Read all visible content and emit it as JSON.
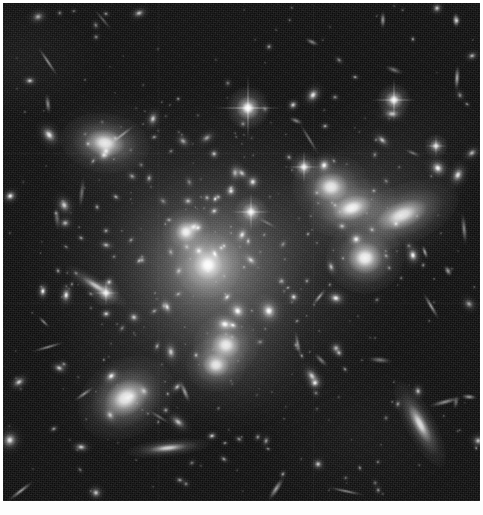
{
  "image": {
    "title": "Galaxy cluster deep field",
    "subject": "galaxy-cluster",
    "modality": "optical-grayscale",
    "width_px": 483,
    "height_px": 515,
    "border": {
      "color": "#ffffff",
      "top_px": 3,
      "left_px": 3,
      "right_px": 3,
      "bottom_px": 14
    },
    "background_color": "#101010",
    "frame": {
      "x": 3,
      "y": 3,
      "width": 477,
      "height": 498
    }
  },
  "palette": {
    "sky": "#101010",
    "faint_source": "#6e6e6e",
    "mid_source": "#b8b8b8",
    "bright_source": "#ffffff",
    "halo": "#8c8c8c",
    "border": "#ffffff"
  },
  "intracluster_light": [
    {
      "name": "main-halo",
      "cx": 218,
      "cy": 262,
      "rx": 150,
      "ry": 130,
      "peak": 0.3,
      "blur": 44
    },
    {
      "name": "core-halo",
      "cx": 212,
      "cy": 268,
      "rx": 78,
      "ry": 72,
      "peak": 0.4,
      "blur": 28
    },
    {
      "name": "inner-core-glow",
      "cx": 207,
      "cy": 265,
      "rx": 34,
      "ry": 32,
      "peak": 0.55,
      "blur": 16
    },
    {
      "name": "ne-group-halo",
      "cx": 372,
      "cy": 208,
      "rx": 78,
      "ry": 52,
      "peak": 0.26,
      "blur": 26
    },
    {
      "name": "se-group-halo",
      "cx": 232,
      "cy": 358,
      "rx": 62,
      "ry": 48,
      "peak": 0.18,
      "blur": 24
    },
    {
      "name": "nw-wisp-halo",
      "cx": 108,
      "cy": 145,
      "rx": 52,
      "ry": 36,
      "peak": 0.14,
      "blur": 22
    }
  ],
  "bright_stars": [
    {
      "name": "star-top-center",
      "cx": 248,
      "cy": 108,
      "size": 9,
      "spike": 66,
      "brightness": 1.0
    },
    {
      "name": "star-upper-right",
      "cx": 394,
      "cy": 100,
      "size": 7,
      "spike": 44,
      "brightness": 0.95
    },
    {
      "name": "star-mid-center",
      "cx": 251,
      "cy": 212,
      "size": 7,
      "spike": 40,
      "brightness": 0.92
    },
    {
      "name": "star-mid-upper",
      "cx": 304,
      "cy": 167,
      "size": 6,
      "spike": 34,
      "brightness": 0.88
    },
    {
      "name": "star-lower-left",
      "cx": 106,
      "cy": 293,
      "size": 6,
      "spike": 26,
      "brightness": 0.85
    },
    {
      "name": "star-right-edge",
      "cx": 436,
      "cy": 146,
      "size": 5,
      "spike": 22,
      "brightness": 0.8
    }
  ],
  "galaxies": [
    {
      "name": "bcg-core",
      "cx": 208,
      "cy": 265,
      "rx": 11,
      "ry": 11,
      "rot": 0,
      "brightness": 1.0
    },
    {
      "name": "bcg-companion",
      "cx": 186,
      "cy": 232,
      "rx": 8,
      "ry": 8,
      "rot": 0,
      "brightness": 0.92
    },
    {
      "name": "elliptical-ne-1",
      "cx": 352,
      "cy": 208,
      "rx": 15,
      "ry": 9,
      "rot": -18,
      "brightness": 0.95
    },
    {
      "name": "elliptical-ne-2",
      "cx": 402,
      "cy": 215,
      "rx": 20,
      "ry": 10,
      "rot": -22,
      "brightness": 0.88
    },
    {
      "name": "elliptical-ne-3",
      "cx": 331,
      "cy": 187,
      "rx": 13,
      "ry": 11,
      "rot": 0,
      "brightness": 0.9
    },
    {
      "name": "elliptical-e",
      "cx": 365,
      "cy": 258,
      "rx": 13,
      "ry": 12,
      "rot": 0,
      "brightness": 0.95
    },
    {
      "name": "elliptical-nw",
      "cx": 105,
      "cy": 143,
      "rx": 15,
      "ry": 10,
      "rot": 8,
      "brightness": 0.9
    },
    {
      "name": "elliptical-sw",
      "cx": 126,
      "cy": 398,
      "rx": 17,
      "ry": 13,
      "rot": -30,
      "brightness": 0.92
    },
    {
      "name": "elliptical-s",
      "cx": 226,
      "cy": 345,
      "rx": 11,
      "ry": 10,
      "rot": 0,
      "brightness": 0.9
    },
    {
      "name": "elliptical-s2",
      "cx": 216,
      "cy": 365,
      "rx": 10,
      "ry": 9,
      "rot": 0,
      "brightness": 0.88
    },
    {
      "name": "lens-arc-se",
      "cx": 420,
      "cy": 424,
      "rx": 16,
      "ry": 5,
      "rot": 62,
      "brightness": 0.85
    },
    {
      "name": "edge-on-sw",
      "cx": 168,
      "cy": 448,
      "rx": 14,
      "ry": 3,
      "rot": -6,
      "brightness": 0.78
    },
    {
      "name": "edge-on-w",
      "cx": 96,
      "cy": 286,
      "rx": 12,
      "ry": 3,
      "rot": 32,
      "brightness": 0.72
    }
  ],
  "source_count_estimate": 420,
  "features": [
    "diffraction-spikes",
    "gravitational-lensing-arcs",
    "intracluster-light",
    "edge-on-spirals",
    "detector-seams"
  ]
}
